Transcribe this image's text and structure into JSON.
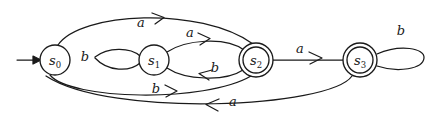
{
  "figure": {
    "name": "finite-state-automaton-diagram",
    "background_color": "#ffffff",
    "stroke_color": "#1a1a1a",
    "width": 438,
    "height": 128
  },
  "start_marker": {
    "name": "start-arrow",
    "target_state": "s0"
  },
  "states": [
    {
      "id": "s0",
      "label": "s",
      "subscript": "0",
      "accepting": false,
      "cx": 55,
      "cy": 60,
      "r": 15
    },
    {
      "id": "s1",
      "label": "s",
      "subscript": "1",
      "accepting": false,
      "cx": 154,
      "cy": 60,
      "r": 15
    },
    {
      "id": "s2",
      "label": "s",
      "subscript": "2",
      "accepting": true,
      "cx": 256,
      "cy": 60,
      "r": 17
    },
    {
      "id": "s3",
      "label": "s",
      "subscript": "3",
      "accepting": true,
      "cx": 360,
      "cy": 60,
      "r": 17
    }
  ],
  "transitions": [
    {
      "name": "edge-s0-to-s2-top",
      "from": "s0",
      "to": "s2",
      "symbol": "a",
      "label_x": 141,
      "label_y": 23,
      "direction": "right"
    },
    {
      "name": "edge-s0-to-s1-lens-upper",
      "from": "s0",
      "to": "s1",
      "symbol": "b",
      "label_x": 85,
      "label_y": 57,
      "direction": "loop"
    },
    {
      "name": "edge-s1-to-s2",
      "from": "s1",
      "to": "s2",
      "symbol": "a",
      "label_x": 192,
      "label_y": 35,
      "direction": "right"
    },
    {
      "name": "edge-s2-to-s1",
      "from": "s2",
      "to": "s1",
      "symbol": "b",
      "label_x": 215,
      "label_y": 69,
      "direction": "left"
    },
    {
      "name": "edge-s2-to-s3",
      "from": "s2",
      "to": "s3",
      "symbol": "a",
      "label_x": 300,
      "label_y": 50,
      "direction": "right"
    },
    {
      "name": "edge-s3-self-loop",
      "from": "s3",
      "to": "s3",
      "symbol": "b",
      "label_x": 401,
      "label_y": 32,
      "direction": "loop"
    },
    {
      "name": "edge-s0-to-s2-bottom",
      "from": "s0",
      "to": "s2",
      "symbol": "b",
      "label_x": 159,
      "label_y": 90,
      "direction": "right"
    },
    {
      "name": "edge-s3-to-s0-bottom",
      "from": "s3",
      "to": "s0",
      "symbol": "a",
      "label_x": 232,
      "label_y": 104,
      "direction": "left"
    }
  ]
}
